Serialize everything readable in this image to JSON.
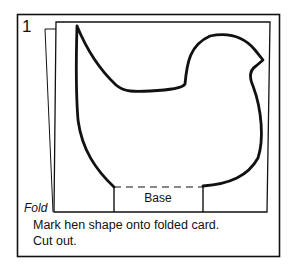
{
  "step": {
    "number": "1"
  },
  "diagram": {
    "fold_label": "Fold",
    "base_label": "Base",
    "colors": {
      "ink": "#111111",
      "background": "#ffffff"
    }
  },
  "caption": {
    "line1": "Mark hen shape onto folded card.",
    "line2": "Cut out."
  }
}
